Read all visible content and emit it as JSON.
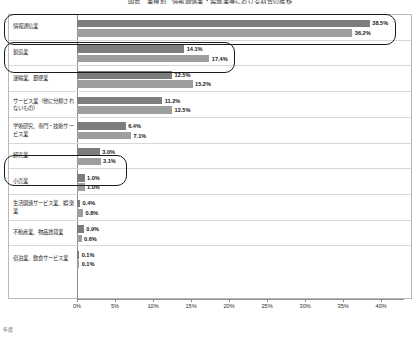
{
  "chart_data": {
    "type": "bar",
    "orientation": "horizontal",
    "title": "図表　業種別　情報通信業・製造業等における割合の推移",
    "xlabel": "",
    "ylabel": "",
    "xlim": [
      0,
      43
    ],
    "xticks": [
      "0%",
      "5%",
      "10%",
      "15%",
      "20%",
      "25%",
      "30%",
      "35%",
      "40%"
    ],
    "xtick_values": [
      0,
      5,
      10,
      15,
      20,
      25,
      30,
      35,
      40
    ],
    "grid": false,
    "legend": "none",
    "categories": [
      "情報通信業",
      "製造業",
      "運輸業、郵便業",
      "サービス業（他に分類されないもの）",
      "学術研究、専門・技術サービス業",
      "卸売業",
      "小売業",
      "生活関連サービス業、娯楽業",
      "不動産業、物品賃貸業",
      "宿泊業、飲食サービス業"
    ],
    "series": [
      {
        "name": "series-1",
        "color": "#7d7d7d",
        "values": [
          38.5,
          14.1,
          12.5,
          11.2,
          6.4,
          3.0,
          1.0,
          0.4,
          0.9,
          0.1
        ],
        "labels": [
          "38.5%",
          "14.1%",
          "12.5%",
          "11.2%",
          "6.4%",
          "3.0%",
          "1.0%",
          "0.4%",
          "0.9%",
          "0.1%"
        ]
      },
      {
        "name": "series-2",
        "color": "#9e9e9e",
        "values": [
          36.2,
          17.4,
          15.2,
          12.5,
          7.1,
          3.1,
          1.0,
          0.8,
          0.6,
          0.1
        ],
        "labels": [
          "36.2%",
          "17.4%",
          "15.2%",
          "12.5%",
          "7.1%",
          "3.1%",
          "1.0%",
          "0.8%",
          "0.6%",
          "0.1%"
        ]
      }
    ],
    "annotations": [
      {
        "name": "highlight-information-communications",
        "category": "情報通信業"
      },
      {
        "name": "highlight-manufacturing",
        "category": "製造業"
      },
      {
        "name": "highlight-wholesale",
        "category": "卸売業"
      }
    ],
    "axis_caption": "年度"
  }
}
